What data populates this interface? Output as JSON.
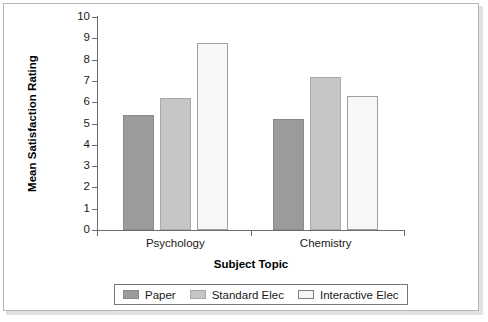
{
  "chart_data": {
    "type": "bar",
    "title": "",
    "xlabel": "Subject Topic",
    "ylabel": "Mean Satisfaction Rating",
    "categories": [
      "Psychology",
      "Chemistry"
    ],
    "series": [
      {
        "name": "Paper",
        "values": [
          5.4,
          5.2
        ],
        "color": "#9b9b9b"
      },
      {
        "name": "Standard Elec",
        "values": [
          6.2,
          7.2
        ],
        "color": "#c6c6c6"
      },
      {
        "name": "Interactive Elec",
        "values": [
          8.8,
          6.3
        ],
        "color": "#f7f7f7"
      }
    ],
    "ylim": [
      0,
      10
    ],
    "ytick_labels": [
      "0",
      "1",
      "2",
      "3",
      "4",
      "5",
      "6",
      "7",
      "8",
      "9",
      "10"
    ],
    "ytick_values": [
      0,
      1,
      2,
      3,
      4,
      5,
      6,
      7,
      8,
      9,
      10
    ],
    "grid": false,
    "legend_position": "bottom"
  }
}
